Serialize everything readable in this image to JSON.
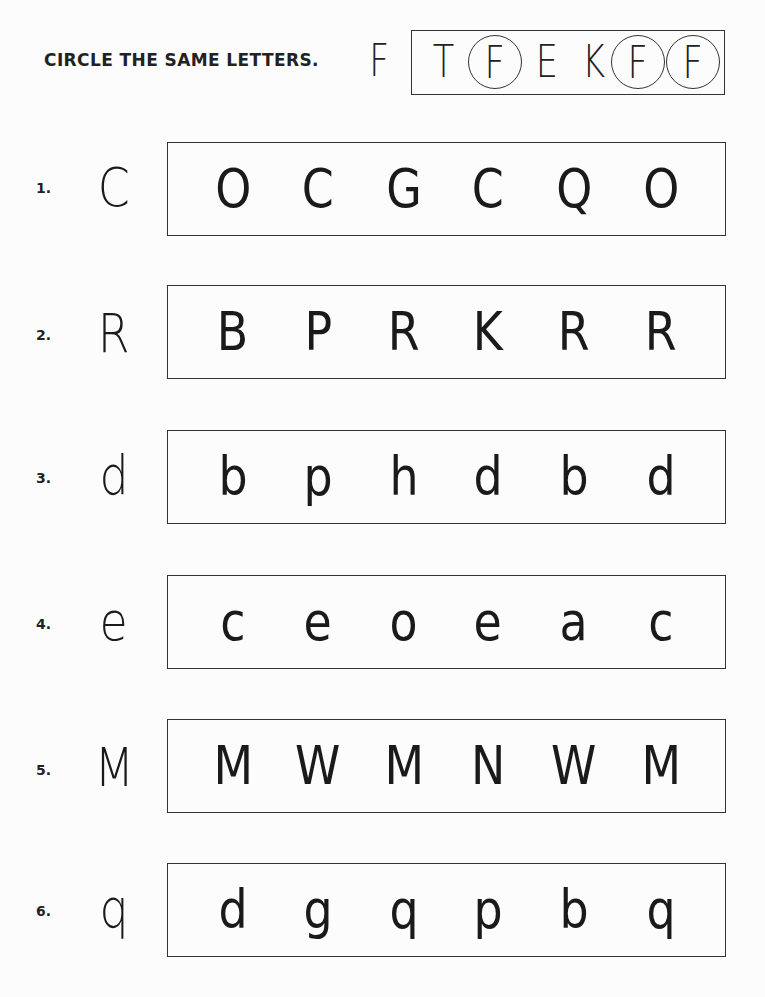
{
  "instruction": "CIRCLE THE SAME LETTERS.",
  "example": {
    "target": "F",
    "options": [
      {
        "letter": "T",
        "circled": false
      },
      {
        "letter": "F",
        "circled": true
      },
      {
        "letter": "E",
        "circled": false
      },
      {
        "letter": "K",
        "circled": false
      },
      {
        "letter": "F",
        "circled": true
      },
      {
        "letter": "F",
        "circled": true
      }
    ]
  },
  "rows": [
    {
      "number": "1.",
      "target": "C",
      "options": [
        "O",
        "C",
        "G",
        "C",
        "Q",
        "O"
      ]
    },
    {
      "number": "2.",
      "target": "R",
      "options": [
        "B",
        "P",
        "R",
        "K",
        "R",
        "R"
      ]
    },
    {
      "number": "3.",
      "target": "d",
      "options": [
        "b",
        "p",
        "h",
        "d",
        "b",
        "d"
      ]
    },
    {
      "number": "4.",
      "target": "e",
      "options": [
        "c",
        "e",
        "o",
        "e",
        "a",
        "c"
      ]
    },
    {
      "number": "5.",
      "target": "M",
      "options": [
        "M",
        "W",
        "M",
        "N",
        "W",
        "M"
      ]
    },
    {
      "number": "6.",
      "target": "q",
      "options": [
        "d",
        "g",
        "q",
        "p",
        "b",
        "q"
      ]
    }
  ],
  "colors": {
    "ink": "#1a1a1a",
    "paper": "#fcfcfc",
    "border": "#333333"
  }
}
